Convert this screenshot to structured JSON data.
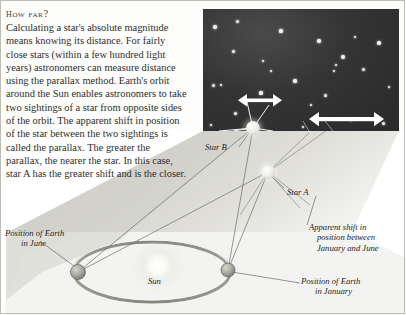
{
  "article": {
    "heading": "How far?",
    "body": "Calculating a star's absolute magnitude means knowing its distance. For fairly close stars (within a few hundred light years) astronomers can measure distance using the parallax method. Earth's orbit around the Sun enables astronomers to take two sightings of a star from opposite sides of the orbit. The apparent shift in position of the star between the two sightings is called the parallax. The greater the parallax, the nearer the star. In this case, star A has the greater shift and is the closer."
  },
  "diagram": {
    "labels": {
      "star_a": "Star A",
      "star_b": "Star B",
      "sun": "Sun",
      "earth_june": "Position of Earth\nin June",
      "earth_june_line1": "Position of Earth",
      "earth_june_line2": "in June",
      "earth_january_line1": "Position of Earth",
      "earth_january_line2": "in January",
      "apparent_shift_line1": "Apparent shift in",
      "apparent_shift_line2": "position between",
      "apparent_shift_line3": "January and June"
    },
    "colors": {
      "sky": "#2e2e2e",
      "star": "#f0efe8",
      "sightline": "#6b6b66",
      "arrow": "#ffffff",
      "orbit": "#8d8d86",
      "ground": "#d9d9d2"
    },
    "arrows": {
      "star_b_shift": "short",
      "star_a_shift": "long"
    },
    "sky_stars": [
      {
        "x": 12,
        "y": 18,
        "r": 1.8
      },
      {
        "x": 34,
        "y": 12,
        "r": 1.5
      },
      {
        "x": 78,
        "y": 22,
        "r": 1.6
      },
      {
        "x": 116,
        "y": 32,
        "r": 1.7
      },
      {
        "x": 152,
        "y": 28,
        "r": 1.4
      },
      {
        "x": 176,
        "y": 34,
        "r": 1.7
      },
      {
        "x": 30,
        "y": 42,
        "r": 1.5
      },
      {
        "x": 60,
        "y": 52,
        "r": 1.3
      },
      {
        "x": 140,
        "y": 48,
        "r": 1.9
      },
      {
        "x": 133,
        "y": 56,
        "r": 1.4
      },
      {
        "x": 131,
        "y": 62,
        "r": 1.3
      },
      {
        "x": 160,
        "y": 60,
        "r": 1.5
      },
      {
        "x": 10,
        "y": 76,
        "r": 1.5
      },
      {
        "x": 18,
        "y": 76,
        "r": 1.4
      },
      {
        "x": 92,
        "y": 72,
        "r": 1.6
      },
      {
        "x": 58,
        "y": 84,
        "r": 1.6
      },
      {
        "x": 122,
        "y": 86,
        "r": 1.5
      },
      {
        "x": 186,
        "y": 78,
        "r": 1.4
      },
      {
        "x": 32,
        "y": 104,
        "r": 1.5
      },
      {
        "x": 8,
        "y": 116,
        "r": 1.4
      },
      {
        "x": 148,
        "y": 110,
        "r": 1.5
      },
      {
        "x": 154,
        "y": 110,
        "r": 1.3
      },
      {
        "x": 180,
        "y": 114,
        "r": 1.5
      },
      {
        "x": 100,
        "y": 118,
        "r": 1.3
      },
      {
        "x": 68,
        "y": 62,
        "r": 1.2
      },
      {
        "x": 108,
        "y": 96,
        "r": 1.2
      }
    ]
  }
}
